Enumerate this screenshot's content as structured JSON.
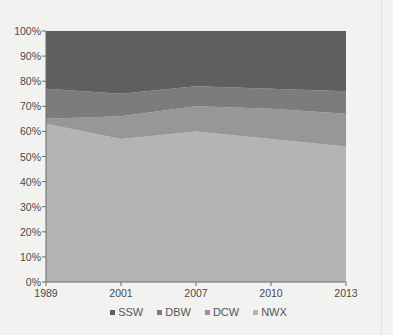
{
  "chart_data": {
    "type": "area",
    "stacked": true,
    "percent": true,
    "title": "",
    "xlabel": "",
    "ylabel": "",
    "categories": [
      "1989",
      "2001",
      "2007",
      "2010",
      "2013"
    ],
    "series": [
      {
        "name": "NWX",
        "values": [
          63,
          57,
          60,
          57,
          54
        ],
        "color": "#b4b4b4"
      },
      {
        "name": "DCW",
        "values": [
          2,
          9,
          10,
          12,
          13
        ],
        "color": "#979797"
      },
      {
        "name": "DBW",
        "values": [
          12,
          9,
          8,
          8,
          9
        ],
        "color": "#7c7c7c"
      },
      {
        "name": "SSW",
        "values": [
          23,
          25,
          22,
          23,
          24
        ],
        "color": "#5f5f5f"
      }
    ],
    "ylim": [
      0,
      100
    ],
    "yticks": [
      "0%",
      "10%",
      "20%",
      "30%",
      "40%",
      "50%",
      "60%",
      "70%",
      "80%",
      "90%",
      "100%"
    ],
    "grid": false,
    "legend_position": "bottom",
    "legend_order": [
      "SSW",
      "DBW",
      "DCW",
      "NWX"
    ]
  },
  "legend": {
    "items": [
      {
        "label": "SSW",
        "color": "#5f5f5f"
      },
      {
        "label": "DBW",
        "color": "#7c7c7c"
      },
      {
        "label": "DCW",
        "color": "#979797"
      },
      {
        "label": "NWX",
        "color": "#b4b4b4"
      }
    ]
  }
}
